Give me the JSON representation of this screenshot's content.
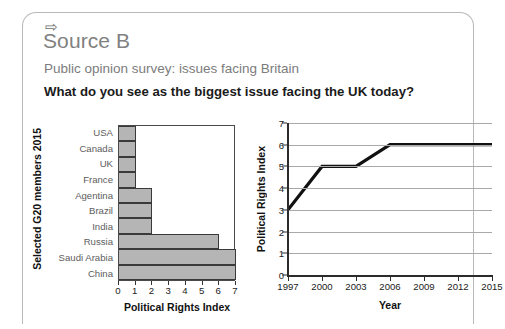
{
  "card": {
    "arrow_icon": "⇨",
    "source_label": "Source B",
    "subtitle": "Public opinion survey: issues facing Britain",
    "question": "What do you see as the biggest issue facing the UK today?"
  },
  "chart_data": [
    {
      "type": "bar",
      "orientation": "horizontal",
      "title": "",
      "xlabel": "Political Rights Index",
      "ylabel": "Selected G20 members 2015",
      "categories": [
        "USA",
        "Canada",
        "UK",
        "France",
        "Agentina",
        "Brazil",
        "India",
        "Russia",
        "Saudi Arabia",
        "China"
      ],
      "values": [
        1,
        1,
        1,
        1,
        2,
        2,
        2,
        6,
        7,
        7
      ],
      "xlim": [
        0,
        7
      ],
      "xticks": [
        0,
        1,
        2,
        3,
        4,
        5,
        6,
        7
      ],
      "xticklabels": [
        "0",
        "1",
        "2",
        "3",
        "4",
        "5",
        "6",
        "7"
      ],
      "grid": false,
      "bar_fill": "#b5b5b5",
      "bar_edge": "#3a3a3a"
    },
    {
      "type": "line",
      "title": "",
      "xlabel": "Year",
      "ylabel": "Political Rights Index",
      "x": [
        1997,
        2000,
        2003,
        2006,
        2009,
        2012,
        2015
      ],
      "values": [
        3,
        5,
        5,
        6,
        6,
        6,
        6
      ],
      "xticks": [
        1997,
        2000,
        2003,
        2006,
        2009,
        2012,
        2015
      ],
      "xticklabels": [
        "1997",
        "2000",
        "2003",
        "2006",
        "2009",
        "2012",
        "2015"
      ],
      "ylim": [
        0,
        7
      ],
      "yticks": [
        0,
        1,
        2,
        3,
        4,
        5,
        6,
        7
      ],
      "yticklabels": [
        "0",
        "1",
        "2",
        "3",
        "4",
        "5",
        "6",
        "7"
      ],
      "grid": true,
      "line_color": "#111111",
      "grid_color": "#a9a9a9"
    }
  ]
}
